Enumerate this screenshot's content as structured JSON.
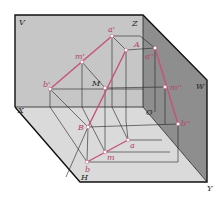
{
  "diagram": {
    "type": "three-plane projection (V, H, W) of line segment AB with point M",
    "colors": {
      "v_plane": "#c9c9c9",
      "w_plane": "#8f8f8f",
      "h_plane": "#dcdcdc",
      "frame": "#111111",
      "construction": "#222222",
      "projection_line": "#c8507a",
      "point": "#ffffff",
      "label_dark": "#222222",
      "label_pink": "#b5446a"
    },
    "planes": {
      "V": "V",
      "W": "W",
      "H": "H"
    },
    "axes": {
      "X": "X",
      "Y": "Y",
      "Z": "Z",
      "O": "O"
    },
    "points": {
      "a1": "a'",
      "m1": "m'",
      "b1": "b'",
      "A": "A",
      "M": "M",
      "B": "B",
      "a2": "a''",
      "m2": "m''",
      "b2": "b''",
      "a": "a",
      "m": "m",
      "b": "b"
    }
  }
}
